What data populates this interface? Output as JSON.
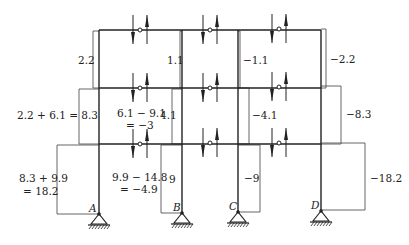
{
  "diagram": {
    "type": "portal-method moment/axial diagram of three-story frame",
    "supports": [
      {
        "id": "A",
        "label": "A",
        "x": 99
      },
      {
        "id": "B",
        "label": "B",
        "x": 182
      },
      {
        "id": "C",
        "label": "C",
        "x": 238
      },
      {
        "id": "D",
        "label": "D",
        "x": 321
      }
    ],
    "stories": {
      "top": {
        "labels": {
          "col_A": "2.2",
          "col_B": "1.1",
          "col_C": "−1.1",
          "col_D": "−2.2"
        }
      },
      "middle": {
        "labels": {
          "col_A": "2.2 + 6.1 = 8.3",
          "col_B_line1": "6.1 − 9.1",
          "col_B_line2": "= −3",
          "col_B_right": "4.1",
          "col_C": "−4.1",
          "col_D": "−8.3"
        }
      },
      "bottom": {
        "labels": {
          "col_A_line1": "8.3 + 9.9",
          "col_A_line2": "= 18.2",
          "col_B_line1": "9.9 − 14.8",
          "col_B_line2": "= −4.9",
          "col_B_right": "9",
          "col_C": "−9",
          "col_D": "−18.2"
        }
      }
    },
    "colors": {
      "line": "#222222",
      "thin_line": "#555555"
    }
  }
}
